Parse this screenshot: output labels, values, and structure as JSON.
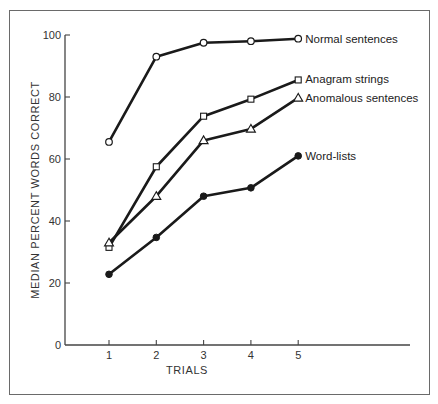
{
  "chart_data": {
    "type": "line",
    "title": "",
    "xlabel": "TRIALS",
    "ylabel": "MEDIAN PERCENT WORDS CORRECT",
    "x": [
      1,
      2,
      3,
      4,
      5
    ],
    "x_ticks": [
      "1",
      "2",
      "3",
      "4",
      "5"
    ],
    "y_ticks": [
      "0",
      "20",
      "40",
      "60",
      "80",
      "100"
    ],
    "ylim": [
      0,
      100
    ],
    "grid": false,
    "legend_position": "inline-right-of-last-point",
    "series": [
      {
        "name": "Normal sentences",
        "marker": "open-circle",
        "values": [
          65.5,
          93,
          97.5,
          98,
          98.8
        ]
      },
      {
        "name": "Anagram strings",
        "marker": "open-square",
        "values": [
          31.5,
          57.5,
          73.8,
          79.3,
          85.5
        ]
      },
      {
        "name": "Anomalous sentences",
        "marker": "open-triangle",
        "values": [
          33,
          48,
          66,
          69.7,
          79.7
        ]
      },
      {
        "name": "Word-lists",
        "marker": "filled-circle",
        "values": [
          22.8,
          34.7,
          48,
          50.7,
          61
        ]
      }
    ]
  },
  "colors": {
    "line": "#1a1a1a",
    "axis": "#444444",
    "frame": "#6a6a6a",
    "text": "#333333"
  }
}
